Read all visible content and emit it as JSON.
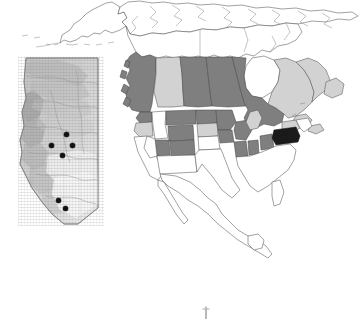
{
  "figure": {
    "title": "Distribution map of North America with Alberta inset",
    "type": "choropleth-map",
    "background_color": "#ffffff",
    "width_px": 360,
    "height_px": 324
  },
  "legend_colors": {
    "shade_dark_fill": "#7f7f7f",
    "shade_light_fill": "#d2d2d2",
    "shade_black_fill": "#1a1a1a",
    "unshaded_fill": "#ffffff",
    "boundary_stroke": "#4a4a4a",
    "point_marker_color": "#111111",
    "inset_base_fill": "#c9c9c9"
  },
  "main_map": {
    "name": "north-america-map",
    "projection_note": "North America, Alaska to Newfoundland, south to Mexico",
    "regions": [
      {
        "name": "Alaska",
        "shade": "unshaded"
      },
      {
        "name": "Yukon",
        "shade": "unshaded"
      },
      {
        "name": "Northwest Territories",
        "shade": "unshaded"
      },
      {
        "name": "Nunavut",
        "shade": "unshaded"
      },
      {
        "name": "British Columbia",
        "shade": "dark"
      },
      {
        "name": "Alberta",
        "shade": "light"
      },
      {
        "name": "Saskatchewan",
        "shade": "dark"
      },
      {
        "name": "Manitoba",
        "shade": "dark"
      },
      {
        "name": "Ontario",
        "shade": "dark"
      },
      {
        "name": "Quebec",
        "shade": "light"
      },
      {
        "name": "Newfoundland and Labrador",
        "shade": "light"
      },
      {
        "name": "New Brunswick",
        "shade": "light"
      },
      {
        "name": "Nova Scotia",
        "shade": "light"
      },
      {
        "name": "Washington",
        "shade": "dark"
      },
      {
        "name": "Oregon",
        "shade": "light"
      },
      {
        "name": "Idaho",
        "shade": "unshaded"
      },
      {
        "name": "Montana",
        "shade": "dark"
      },
      {
        "name": "North Dakota",
        "shade": "dark"
      },
      {
        "name": "South Dakota",
        "shade": "light"
      },
      {
        "name": "Minnesota",
        "shade": "dark"
      },
      {
        "name": "Wisconsin",
        "shade": "dark"
      },
      {
        "name": "Michigan",
        "shade": "light"
      },
      {
        "name": "Wyoming",
        "shade": "dark"
      },
      {
        "name": "Colorado",
        "shade": "dark"
      },
      {
        "name": "Utah",
        "shade": "dark"
      },
      {
        "name": "Nebraska",
        "shade": "unshaded"
      },
      {
        "name": "Iowa",
        "shade": "dark"
      },
      {
        "name": "Illinois",
        "shade": "dark"
      },
      {
        "name": "Indiana",
        "shade": "dark"
      },
      {
        "name": "Ohio",
        "shade": "dark"
      },
      {
        "name": "New York",
        "shade": "light"
      },
      {
        "name": "Pennsylvania",
        "shade": "black"
      },
      {
        "name": "Mexico",
        "shade": "unshaded"
      }
    ]
  },
  "inset_map": {
    "name": "alberta-inset-map",
    "region_label": "Alberta",
    "fill_note": "shaded relief / ecoregion raster",
    "sample_points": [
      {
        "id": 1,
        "x_px": 66,
        "y_px": 134
      },
      {
        "id": 2,
        "x_px": 51,
        "y_px": 145
      },
      {
        "id": 3,
        "x_px": 72,
        "y_px": 145
      },
      {
        "id": 4,
        "x_px": 62,
        "y_px": 155
      },
      {
        "id": 5,
        "x_px": 58,
        "y_px": 200
      },
      {
        "id": 6,
        "x_px": 65,
        "y_px": 208
      }
    ],
    "sample_point_count": 6
  },
  "annotations": {
    "scale_mark": "north-arrow-mark"
  }
}
